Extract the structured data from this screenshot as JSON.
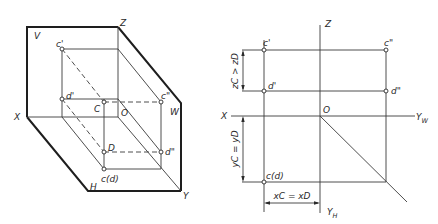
{
  "left_diagram": {
    "title": "Pictorial view of projection planes",
    "labels": {
      "V": "V",
      "Z": "Z",
      "X": "X",
      "H": "H",
      "Y": "Y",
      "W": "W",
      "O": "O",
      "C": "C",
      "D": "D",
      "c_prime": "c'",
      "d_prime": "d'",
      "c_dprime": "c\"",
      "d_dprime": "d\"",
      "cd": "c(d)"
    }
  },
  "right_diagram": {
    "title": "Orthographic projection of points C and D",
    "labels": {
      "Z": "Z",
      "X": "X",
      "O": "O",
      "YW": "Y",
      "YW_sub": "W",
      "YH": "Y",
      "YH_sub": "H",
      "c_prime": "c'",
      "d_prime": "d'",
      "c_dprime": "c\"",
      "d_dprime": "d\"",
      "cd": "c(d)"
    },
    "dimensions": {
      "z_relation": "zC > zD",
      "y_relation": "yC = yD",
      "x_relation": "xC = xD"
    }
  }
}
